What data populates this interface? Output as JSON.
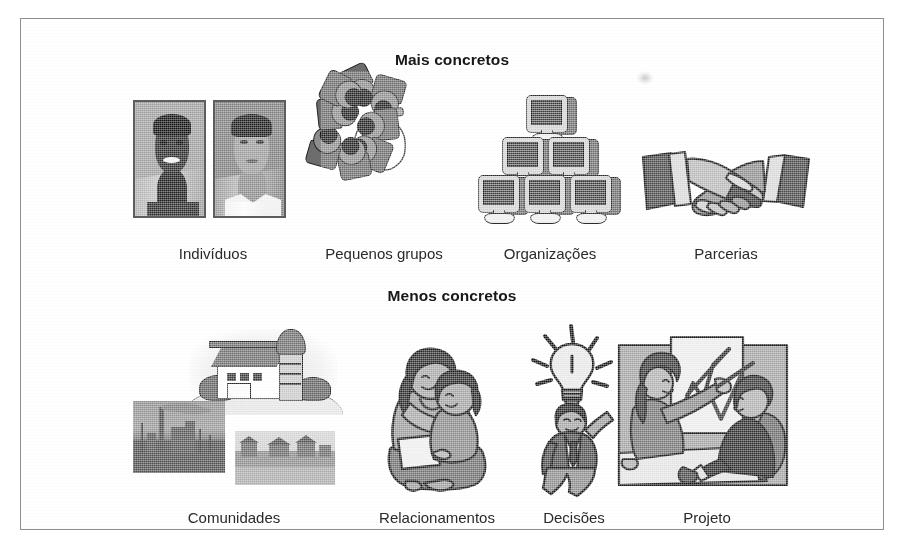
{
  "figure": {
    "border_color": "#8f8f8f",
    "background": "#ffffff",
    "rows": [
      {
        "heading": "Mais concretos",
        "items": [
          {
            "label": "Indivíduos",
            "icon": "two-portrait-photos-icon"
          },
          {
            "label": "Pequenos grupos",
            "icon": "overhead-meeting-group-icon"
          },
          {
            "label": "Organizações",
            "icon": "monitor-pyramid-icon"
          },
          {
            "label": "Parcerias",
            "icon": "handshake-icon"
          }
        ]
      },
      {
        "heading": "Menos concretos",
        "items": [
          {
            "label": "Comunidades",
            "icon": "barn-and-town-photos-icon"
          },
          {
            "label": "Relacionamentos",
            "icon": "mother-and-child-icon"
          },
          {
            "label": "Decisões",
            "icon": "lightbulb-idea-person-icon"
          },
          {
            "label": "Projeto",
            "icon": "presentation-meeting-icon"
          }
        ]
      }
    ]
  }
}
